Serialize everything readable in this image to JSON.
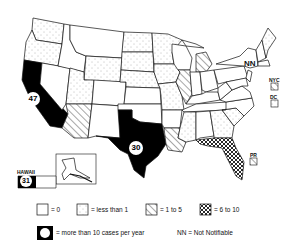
{
  "map": {
    "subject": "Cases per year by state",
    "state_labels": {
      "california": "47",
      "texas": "30",
      "hawaii_value": "31",
      "hawaii_label": "HAWAII",
      "new_york": "NN",
      "nyc": "NYC",
      "dc": "DC",
      "pr": "PR"
    }
  },
  "legend": {
    "items": [
      {
        "symbol": "blank",
        "label": "= 0"
      },
      {
        "symbol": "dotted",
        "label": "= less than 1"
      },
      {
        "symbol": "hatched",
        "label": "= 1 to 5"
      },
      {
        "symbol": "crosshatch",
        "label": "= 6 to 10"
      },
      {
        "symbol": "black-circle",
        "label": "= more than 10 cases per year"
      }
    ],
    "nn_note": "NN = Not Notifiable"
  }
}
